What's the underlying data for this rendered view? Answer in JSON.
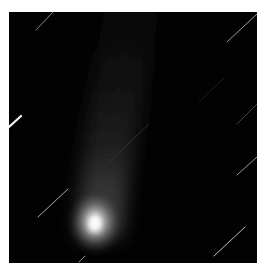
{
  "image": {
    "subject": "comet with tail against star field",
    "alt": "Comet nucleus near bottom with faint tail extending upward; diagonal star trails",
    "colors": {
      "background": "#020202",
      "page": "#ffffff",
      "nucleus": "#ffffff",
      "tail": "#5a5a5a",
      "star_trail": "#d8d8d8"
    }
  }
}
